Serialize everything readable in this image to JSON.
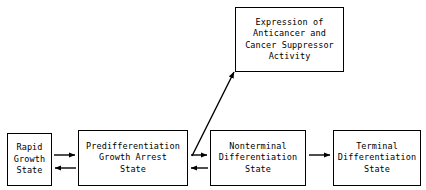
{
  "diagram": {
    "background_color": "#ffffff",
    "line_color": "#000000",
    "nodes": [
      {
        "id": "expression",
        "name": "expression-box",
        "lines": [
          "Expression of",
          "Anticancer and",
          "Cancer Suppressor",
          "Activity"
        ]
      },
      {
        "id": "rapid_growth",
        "name": "rapid-growth-state-box",
        "lines": [
          "Rapid",
          "Growth",
          "State"
        ]
      },
      {
        "id": "predifferentiation",
        "name": "predifferentiation-growth-arrest-state-box",
        "lines": [
          "Predifferentiation",
          "Growth Arrest",
          "State"
        ]
      },
      {
        "id": "nonterminal",
        "name": "nonterminal-differentiation-state-box",
        "lines": [
          "Nonterminal",
          "Differentiation",
          "State"
        ]
      },
      {
        "id": "terminal",
        "name": "terminal-differentiation-state-box",
        "lines": [
          "Terminal",
          "Differentiation",
          "State"
        ]
      }
    ],
    "edges": [
      {
        "id": "rapid_to_predifferentiation",
        "name": "arrow-rapid-growth-to-predifferentiation",
        "from": "rapid_growth",
        "to": "predifferentiation",
        "direction": "right"
      },
      {
        "id": "predifferentiation_to_rapid",
        "name": "arrow-predifferentiation-to-rapid-growth",
        "from": "predifferentiation",
        "to": "rapid_growth",
        "direction": "left"
      },
      {
        "id": "predifferentiation_to_nonterminal",
        "name": "arrow-predifferentiation-to-nonterminal",
        "from": "predifferentiation",
        "to": "nonterminal",
        "direction": "right"
      },
      {
        "id": "nonterminal_to_predifferentiation",
        "name": "arrow-nonterminal-to-predifferentiation",
        "from": "nonterminal",
        "to": "predifferentiation",
        "direction": "left"
      },
      {
        "id": "predifferentiation_to_expression",
        "name": "arrow-predifferentiation-to-expression",
        "from": "predifferentiation",
        "to": "expression",
        "direction": "diagonal-up-right"
      },
      {
        "id": "nonterminal_to_terminal",
        "name": "arrow-nonterminal-to-terminal",
        "from": "nonterminal",
        "to": "terminal",
        "direction": "right"
      }
    ]
  }
}
